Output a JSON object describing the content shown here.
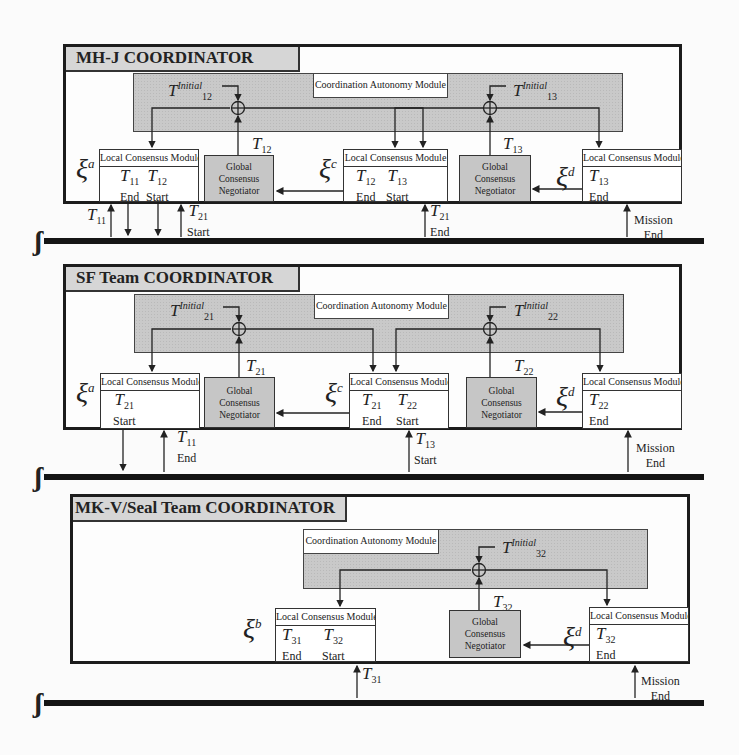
{
  "panels": [
    {
      "title": "MH-J COORDINATOR",
      "cam_label": "Coordination Autonomy Module",
      "summers": [
        {
          "input_var": "T",
          "input_sup": "Initial",
          "input_sub": "12"
        },
        {
          "input_var": "T",
          "input_sup": "Initial",
          "input_sub": "13"
        }
      ],
      "negotiators": [
        {
          "label_lines": [
            "Global",
            "Consensus",
            "Negotiator"
          ],
          "output_var": "T",
          "output_sub": "12"
        },
        {
          "label_lines": [
            "Global",
            "Consensus",
            "Negotiator"
          ],
          "output_var": "T",
          "output_sub": "13"
        }
      ],
      "local_modules": [
        {
          "entity": "ξ",
          "entity_sup": "a",
          "header": "Local Consensus Module",
          "cells": [
            {
              "var": "T",
              "sub": "11",
              "label": "End"
            },
            {
              "var": "T",
              "sub": "12",
              "label": "Start"
            }
          ]
        },
        {
          "entity": "ξ",
          "entity_sup": "c",
          "header": "Local Consensus Module",
          "cells": [
            {
              "var": "T",
              "sub": "12",
              "label": "End"
            },
            {
              "var": "T",
              "sub": "13",
              "label": "Start"
            }
          ]
        },
        {
          "entity": "ξ",
          "entity_sup": "d",
          "header": "Local Consensus Module",
          "cells": [
            {
              "var": "T",
              "sub": "13",
              "label": "End"
            }
          ]
        }
      ],
      "timeline_labels": [
        {
          "var": "T",
          "sub": "11",
          "label": ""
        },
        {
          "var": "T",
          "sub": "21",
          "label": "Start"
        },
        {
          "var": "T",
          "sub": "21",
          "label": "End"
        },
        {
          "var": "",
          "sub": "",
          "label": "Mission",
          "label2": "End"
        }
      ]
    },
    {
      "title": "SF Team COORDINATOR",
      "cam_label": "Coordination Autonomy Module",
      "summers": [
        {
          "input_var": "T",
          "input_sup": "Initial",
          "input_sub": "21"
        },
        {
          "input_var": "T",
          "input_sup": "Initial",
          "input_sub": "22"
        }
      ],
      "negotiators": [
        {
          "label_lines": [
            "Global",
            "Consensus",
            "Negotiator"
          ],
          "output_var": "T",
          "output_sub": "21"
        },
        {
          "label_lines": [
            "Global",
            "Consensus",
            "Negotiator"
          ],
          "output_var": "T",
          "output_sub": "22"
        }
      ],
      "local_modules": [
        {
          "entity": "ξ",
          "entity_sup": "a",
          "header": "Local Consensus Module",
          "cells": [
            {
              "var": "T",
              "sub": "21",
              "label": "Start"
            }
          ]
        },
        {
          "entity": "ξ",
          "entity_sup": "c",
          "header": "Local Consensus Module",
          "cells": [
            {
              "var": "T",
              "sub": "21",
              "label": "End"
            },
            {
              "var": "T",
              "sub": "22",
              "label": "Start"
            }
          ]
        },
        {
          "entity": "ξ",
          "entity_sup": "d",
          "header": "Local Consensus Module",
          "cells": [
            {
              "var": "T",
              "sub": "22",
              "label": "End"
            }
          ]
        }
      ],
      "timeline_labels": [
        {
          "var": "T",
          "sub": "11",
          "label": "End"
        },
        {
          "var": "T",
          "sub": "13",
          "label": "Start"
        },
        {
          "var": "",
          "sub": "",
          "label": "Mission",
          "label2": "End"
        }
      ]
    },
    {
      "title": "MK-V/Seal Team COORDINATOR",
      "cam_label": "Coordination Autonomy Module",
      "summers": [
        {
          "input_var": "T",
          "input_sup": "Initial",
          "input_sub": "32"
        }
      ],
      "negotiators": [
        {
          "label_lines": [
            "Global",
            "Consensus",
            "Negotiator"
          ],
          "output_var": "T",
          "output_sub": "32"
        }
      ],
      "local_modules": [
        {
          "entity": "ξ",
          "entity_sup": "b",
          "header": "Local Consensus Module",
          "cells": [
            {
              "var": "T",
              "sub": "31",
              "label": "End"
            },
            {
              "var": "T",
              "sub": "32",
              "label": "Start"
            }
          ]
        },
        {
          "entity": "ξ",
          "entity_sup": "d",
          "header": "Local Consensus Module",
          "cells": [
            {
              "var": "T",
              "sub": "32",
              "label": "End"
            }
          ]
        }
      ],
      "timeline_labels": [
        {
          "var": "T",
          "sub": "31",
          "label": ""
        },
        {
          "var": "",
          "sub": "",
          "label": "Mission",
          "label2": "End"
        }
      ]
    }
  ],
  "timeline_symbol": "ʃ",
  "colors": {
    "panel_border": "#1c1c1c",
    "title_fill": "#d6d6d6",
    "cam_fill": "#c9c9c9",
    "negotiator_fill": "#c6c6c6",
    "timeline": "#151515"
  }
}
